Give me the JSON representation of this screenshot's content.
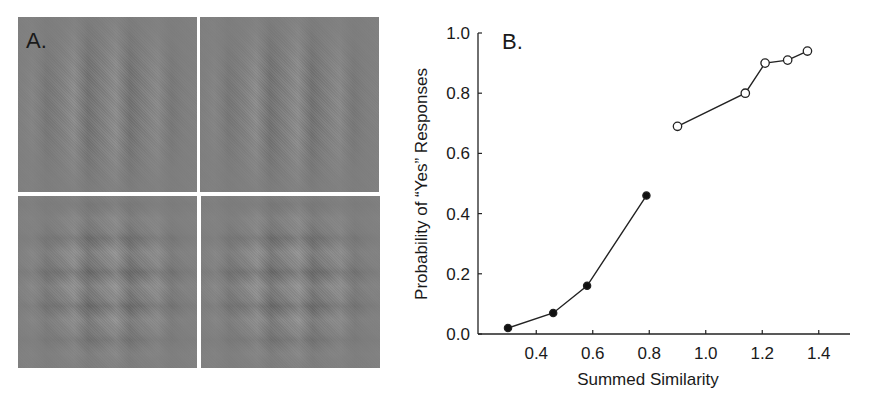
{
  "panel_a": {
    "label": "A.",
    "patches": [
      {
        "position": "top-left",
        "pattern": "vertical-grating"
      },
      {
        "position": "top-right",
        "pattern": "vertical-grating"
      },
      {
        "position": "bottom-left",
        "pattern": "plaid-grating"
      },
      {
        "position": "bottom-right",
        "pattern": "plaid-grating"
      }
    ],
    "patch_color": "#7f7f7f"
  },
  "panel_b": {
    "label": "B."
  },
  "chart_data": {
    "type": "line",
    "title": "",
    "panel_label": "B.",
    "xlabel": "Summed Similarity",
    "ylabel": "Probability of “Yes” Responses",
    "xlim": [
      0.2,
      1.6
    ],
    "ylim": [
      0.0,
      1.0
    ],
    "xticks": [
      "0.4",
      "0.6",
      "0.8",
      "1.0",
      "1.2",
      "1.4"
    ],
    "yticks": [
      "0.0",
      "0.2",
      "0.4",
      "0.6",
      "0.8",
      "1.0"
    ],
    "grid": false,
    "legend": null,
    "series": [
      {
        "name": "filled",
        "marker": "filled-circle",
        "x": [
          0.3,
          0.46,
          0.58,
          0.79
        ],
        "y": [
          0.02,
          0.07,
          0.16,
          0.46
        ]
      },
      {
        "name": "open",
        "marker": "open-circle",
        "x": [
          0.9,
          1.14,
          1.21,
          1.29,
          1.36
        ],
        "y": [
          0.69,
          0.8,
          0.9,
          0.91,
          0.94
        ]
      }
    ]
  }
}
